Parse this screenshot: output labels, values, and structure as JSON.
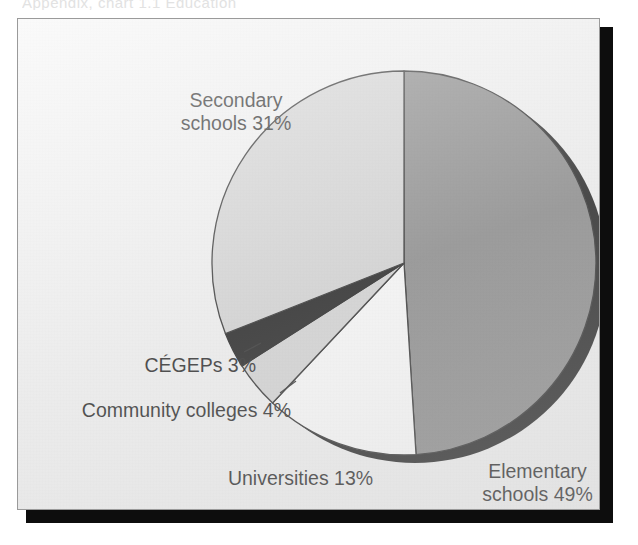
{
  "top_caption": "Appendix, chart 1.1  Education",
  "chart_frame": {
    "background_color": "#f4f4f4",
    "border_color": "#9a9a9a",
    "shadow_color": "#0d0d0d"
  },
  "chart_data": {
    "type": "pie",
    "title": "",
    "subtitle": "",
    "xlabel": "",
    "ylabel": "",
    "legend_position": "none",
    "grid": false,
    "start_angle_deg": 0,
    "direction": "clockwise",
    "center": {
      "x": 403,
      "y": 262
    },
    "radius": 192,
    "categories": [
      "Elementary schools",
      "Universities",
      "Community colleges",
      "CÉGEPs",
      "Secondary schools"
    ],
    "values": [
      49,
      13,
      4,
      3,
      31
    ],
    "unit": "%",
    "slices": [
      {
        "name": "Elementary schools",
        "label": "Elementary schools 49%",
        "label_line1": "Elementary",
        "label_line2": "schools 49%",
        "value": 49,
        "color": "#828282",
        "stroke": "#1a1a1a",
        "start_pct": 0,
        "end_pct": 49
      },
      {
        "name": "Universities",
        "label": "Universities 13%",
        "label_line1": "Universities 13%",
        "label_line2": "",
        "value": 13,
        "color": "#ffffff",
        "stroke": "#1a1a1a",
        "start_pct": 49,
        "end_pct": 62
      },
      {
        "name": "Community colleges",
        "label": "Community colleges 4%",
        "label_line1": "Community colleges 4%",
        "label_line2": "",
        "value": 4,
        "color": "#d4d4d4",
        "stroke": "#1a1a1a",
        "start_pct": 62,
        "end_pct": 66
      },
      {
        "name": "CÉGEPs",
        "label": "CÉGEPs 3%",
        "label_line1": "CÉGEPs 3%",
        "label_line2": "",
        "value": 3,
        "color": "#0a0a0a",
        "stroke": "#0a0a0a",
        "start_pct": 66,
        "end_pct": 69
      },
      {
        "name": "Secondary schools",
        "label": "Secondary schools 31%",
        "label_line1": "Secondary",
        "label_line2": "schools 31%",
        "value": 31,
        "color": "#d4d4d4",
        "stroke": "#1a1a1a",
        "start_pct": 69,
        "end_pct": 100
      }
    ]
  }
}
